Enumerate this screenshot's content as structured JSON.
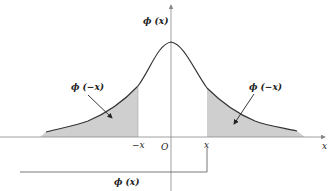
{
  "diagram": {
    "labels": {
      "y_axis": "ϕ (x)",
      "x_axis": "x",
      "origin": "O",
      "neg_x": "−x",
      "pos_x": "x",
      "left_tail": "ϕ (−x)",
      "right_tail": "ϕ (−x)",
      "cumulative": "ϕ (x)"
    },
    "colors": {
      "curve": "#333333",
      "axis": "#888888",
      "tail_fill": "#cfcfcf",
      "arrow": "#222222"
    },
    "annotations": [
      {
        "text": "ϕ (−x)",
        "points_to": "left shaded tail (x < −x)"
      },
      {
        "text": "ϕ (−x)",
        "points_to": "right shaded tail (x > x)"
      },
      {
        "text": "ϕ (x)",
        "describes": "area from left tail up to x (bracket)"
      }
    ]
  }
}
